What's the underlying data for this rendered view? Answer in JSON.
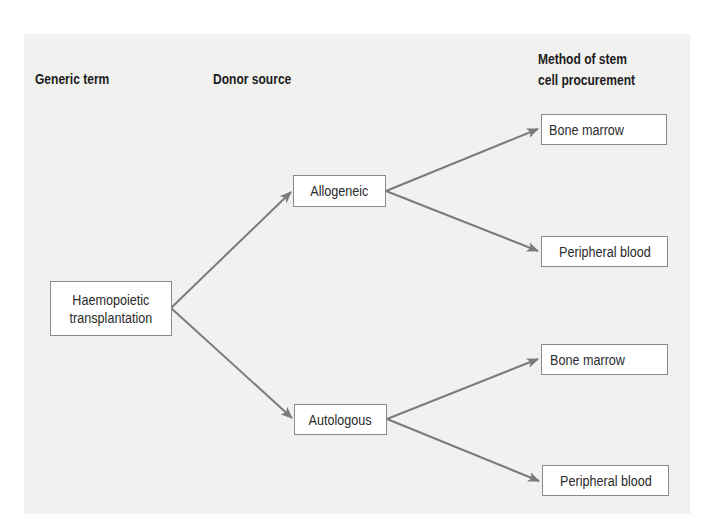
{
  "headings": {
    "generic_term": "Generic term",
    "donor_source": "Donor source",
    "method_line1": "Method of stem",
    "method_line2": "cell procurement"
  },
  "nodes": {
    "root": {
      "line1": "Haemopoietic",
      "line2": "transplantation"
    },
    "allogeneic": "Allogeneic",
    "autologous": "Autologous",
    "allo_bone_marrow": "Bone marrow",
    "allo_peripheral_blood": "Peripheral blood",
    "auto_bone_marrow": "Bone marrow",
    "auto_peripheral_blood": "Peripheral blood"
  },
  "colors": {
    "panel_background": "#f1f1f0",
    "arrow": "#7a7a7a",
    "box_border": "#8a8a8a",
    "heading_text": "#1c1c1c"
  },
  "edges": [
    {
      "from": "Haemopoietic transplantation",
      "to": "Allogeneic"
    },
    {
      "from": "Haemopoietic transplantation",
      "to": "Autologous"
    },
    {
      "from": "Allogeneic",
      "to": "Bone marrow"
    },
    {
      "from": "Allogeneic",
      "to": "Peripheral blood"
    },
    {
      "from": "Autologous",
      "to": "Bone marrow"
    },
    {
      "from": "Autologous",
      "to": "Peripheral blood"
    }
  ]
}
